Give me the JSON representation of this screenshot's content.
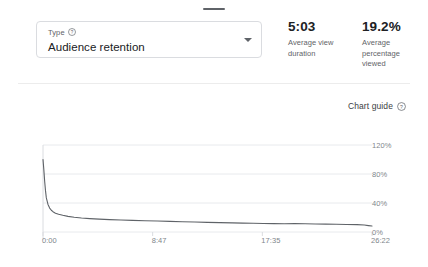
{
  "window": {
    "drag_handle": "drag-handle"
  },
  "type_selector": {
    "label": "Type",
    "help_icon": "help-circle-icon",
    "value": "Audience retention",
    "dropdown_icon": "chevron-down-icon"
  },
  "stats": [
    {
      "value": "5:03",
      "label": "Average view duration"
    },
    {
      "value": "19.2%",
      "label": "Average percentage viewed"
    }
  ],
  "chart_guide": {
    "label": "Chart guide",
    "help_icon": "help-circle-icon"
  },
  "chart_data": {
    "type": "line",
    "title": "Audience retention",
    "xlabel": "",
    "ylabel": "",
    "grid": true,
    "legend_position": "none",
    "line_color": "#5f6368",
    "x_tick_labels": [
      "0:00",
      "8:47",
      "17:35",
      "26:22"
    ],
    "y_tick_labels": [
      "120%",
      "80%",
      "40%",
      "0%"
    ],
    "ylim": [
      0,
      120
    ],
    "xlim": [
      0,
      1582
    ],
    "x_unit": "seconds",
    "x": [
      0,
      4,
      8,
      12,
      16,
      24,
      32,
      40,
      48,
      60,
      75,
      95,
      120,
      150,
      185,
      225,
      270,
      320,
      375,
      430,
      490,
      550,
      610,
      670,
      730,
      790,
      850,
      910,
      960,
      1010,
      1060,
      1110,
      1160,
      1210,
      1260,
      1310,
      1360,
      1410,
      1460,
      1510,
      1545,
      1565,
      1582
    ],
    "values": [
      100,
      86,
      70,
      57,
      47,
      38,
      33,
      30,
      28,
      26,
      24.5,
      23,
      21.5,
      20.3,
      19.3,
      18.5,
      17.8,
      17.1,
      16.5,
      16.0,
      15.5,
      15.1,
      14.6,
      14.2,
      13.7,
      13.3,
      12.9,
      12.6,
      12.3,
      12.0,
      11.8,
      11.6,
      11.4,
      11.6,
      11.3,
      11.0,
      10.8,
      10.6,
      10.4,
      10.2,
      9.6,
      8.8,
      8.2
    ]
  }
}
